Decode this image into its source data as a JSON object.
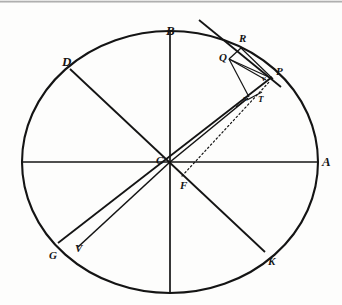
{
  "figure": {
    "width": 342,
    "height": 305,
    "background_color": "#fdfdfc",
    "ink_color": "#141414"
  },
  "labels": {
    "A": "A",
    "B": "B",
    "C": "C",
    "D": "D",
    "F": "F",
    "G": "G",
    "K": "K",
    "P": "P",
    "Q": "Q",
    "R": "R",
    "T": "T",
    "V": "V",
    "v": "v",
    "x": "x"
  },
  "geometry": {
    "ellipse": {
      "center_x": 170,
      "center_y": 162,
      "radius_x": 148,
      "radius_y": 131
    },
    "points": {
      "A": {
        "x": 318,
        "y": 162
      },
      "B": {
        "x": 170,
        "y": 31
      },
      "C": {
        "x": 170,
        "y": 162
      },
      "D": {
        "x": 70,
        "y": 69
      },
      "F": {
        "x": 186,
        "y": 180
      },
      "G": {
        "x": 58,
        "y": 243
      },
      "K": {
        "x": 265,
        "y": 252
      },
      "P": {
        "x": 272,
        "y": 77
      },
      "Q": {
        "x": 230,
        "y": 57
      },
      "R": {
        "x": 240,
        "y": 46
      },
      "T": {
        "x": 258,
        "y": 96
      },
      "V": {
        "x": 78,
        "y": 247
      },
      "v": {
        "x": 263,
        "y": 79
      },
      "x": {
        "x": 247,
        "y": 99
      },
      "left_end": {
        "x": 22,
        "y": 162
      },
      "bottom_end": {
        "x": 170,
        "y": 293
      },
      "tangent_far": {
        "x": 200,
        "y": 21
      }
    }
  },
  "segments": [
    {
      "name": "diameter-AC-left",
      "from": "left_end",
      "to": "A",
      "style": "solid"
    },
    {
      "name": "diameter-B-bottom",
      "from": "B",
      "to": "bottom_end",
      "style": "solid"
    },
    {
      "name": "diameter-DK",
      "from": "D",
      "to": "K",
      "style": "solid"
    },
    {
      "name": "diameter-GP-tangentline",
      "from": "G",
      "to": "P",
      "style": "solid"
    },
    {
      "name": "radius-CV",
      "from": "C",
      "to": "V",
      "style": "solid"
    },
    {
      "name": "chord-QR",
      "from": "Q",
      "to": "R",
      "style": "solid"
    },
    {
      "name": "chord-QP",
      "from": "Q",
      "to": "P",
      "style": "solid"
    },
    {
      "name": "chord-Qv",
      "from": "Q",
      "to": "v",
      "style": "solid"
    },
    {
      "name": "chord-Qx",
      "from": "Q",
      "to": "x",
      "style": "solid"
    },
    {
      "name": "chord-RP",
      "from": "R",
      "to": "P",
      "style": "solid"
    },
    {
      "name": "segment-xT",
      "from": "x",
      "to": "T",
      "style": "solid"
    },
    {
      "name": "dotted-FP",
      "from": "F",
      "to": "P",
      "style": "dotted"
    }
  ]
}
